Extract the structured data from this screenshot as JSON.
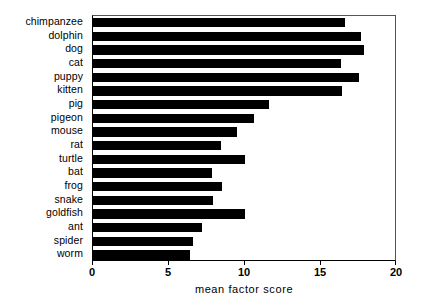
{
  "chart_data": {
    "type": "bar",
    "orientation": "horizontal",
    "title": "",
    "xlabel": "mean factor score",
    "ylabel": "",
    "xlim": [
      0,
      20
    ],
    "ylim": null,
    "grid": false,
    "legend": null,
    "bar_color": "#000000",
    "background_color": "#ffffff",
    "xticks": [
      0,
      5,
      10,
      15,
      20
    ],
    "xticklabels": [
      "0",
      "5",
      "10",
      "15",
      "20"
    ],
    "categories": [
      "chimpanzee",
      "dolphin",
      "dog",
      "cat",
      "puppy",
      "kitten",
      "pig",
      "pigeon",
      "mouse",
      "rat",
      "turtle",
      "bat",
      "frog",
      "snake",
      "goldfish",
      "ant",
      "spider",
      "worm"
    ],
    "values": [
      16.6,
      17.6,
      17.8,
      16.3,
      17.5,
      16.4,
      11.6,
      10.6,
      9.5,
      8.4,
      10.0,
      7.8,
      8.5,
      7.9,
      10.0,
      7.2,
      6.6,
      6.4
    ]
  }
}
